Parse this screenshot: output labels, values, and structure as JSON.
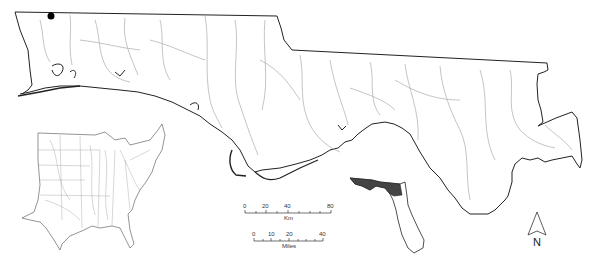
{
  "map": {
    "type": "study-area map",
    "region": "Florida Panhandle and adjacent coastal plain river basins",
    "main_outline_color": "#222222",
    "river_color": "#a8a8a8",
    "study_point_color": "#000000"
  },
  "inset_us": {
    "description": "Eastern United States with river network",
    "line_color": "#888888"
  },
  "inset_florida": {
    "description": "Florida locator with study area highlighted",
    "highlight_color": "#444444"
  },
  "scale_km": {
    "ticks": [
      "0",
      "20",
      "40",
      "80"
    ],
    "unit": "Km"
  },
  "scale_miles": {
    "ticks": [
      "0",
      "10",
      "20",
      "40"
    ],
    "unit": "Miles"
  },
  "north_arrow": {
    "label": "N"
  }
}
